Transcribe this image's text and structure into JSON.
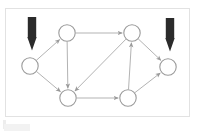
{
  "figure": {
    "type": "directed-graph-diagram",
    "title": "",
    "frame": {
      "x": 5,
      "y": 8,
      "width": 185,
      "height": 109,
      "border_color": "#e2e2e2",
      "background": "#ffffff"
    },
    "canvas": {
      "width": 206,
      "height": 136
    }
  },
  "style": {
    "node_stroke": "#9a9a9a",
    "node_fill": "#ffffff",
    "node_stroke_width": 1.1,
    "node_radius": 8.2,
    "edge_color": "#b3b3b3",
    "edge_width": 1.0,
    "arrowhead_color": "#9a9a9a",
    "marker_color": "#2b2b2b"
  },
  "nodes": [
    {
      "id": "n1",
      "label": "",
      "name": "node-left-source",
      "x": 30,
      "y": 66
    },
    {
      "id": "n2",
      "label": "",
      "name": "node-top-center",
      "x": 67,
      "y": 33
    },
    {
      "id": "n3",
      "label": "",
      "name": "node-top-right",
      "x": 132,
      "y": 33
    },
    {
      "id": "n4",
      "label": "",
      "name": "node-bottom-left",
      "x": 68,
      "y": 98
    },
    {
      "id": "n5",
      "label": "",
      "name": "node-bottom-right",
      "x": 128,
      "y": 98
    },
    {
      "id": "n6",
      "label": "",
      "name": "node-right-sink",
      "x": 168,
      "y": 67
    }
  ],
  "edges": [
    {
      "id": "e1",
      "from": "n1",
      "to": "n2",
      "name": "edge-left-to-top-center",
      "directed": true
    },
    {
      "id": "e2",
      "from": "n1",
      "to": "n4",
      "name": "edge-left-to-bottom-left",
      "directed": true
    },
    {
      "id": "e3",
      "from": "n2",
      "to": "n3",
      "name": "edge-top-center-to-top-right",
      "directed": true
    },
    {
      "id": "e4",
      "from": "n2",
      "to": "n4",
      "name": "edge-top-center-to-bottom-left",
      "directed": true
    },
    {
      "id": "e5",
      "from": "n3",
      "to": "n4",
      "name": "edge-top-right-to-bottom-left",
      "directed": true
    },
    {
      "id": "e6",
      "from": "n3",
      "to": "n6",
      "name": "edge-top-right-to-right",
      "directed": true
    },
    {
      "id": "e7",
      "from": "n4",
      "to": "n5",
      "name": "edge-bottom-left-to-bottom-right",
      "directed": true
    },
    {
      "id": "e8",
      "from": "n5",
      "to": "n3",
      "name": "edge-bottom-right-to-top-right",
      "directed": true
    },
    {
      "id": "e9",
      "from": "n5",
      "to": "n6",
      "name": "edge-bottom-right-to-right",
      "directed": true
    }
  ],
  "markers": [
    {
      "id": "m1",
      "name": "source-marker-arrow",
      "target": "n1",
      "x": 32,
      "y": 23,
      "direction": "down",
      "color": "#2b2b2b"
    },
    {
      "id": "m2",
      "name": "sink-marker-arrow",
      "target": "n6",
      "x": 170,
      "y": 24,
      "direction": "down",
      "color": "#2b2b2b"
    }
  ]
}
